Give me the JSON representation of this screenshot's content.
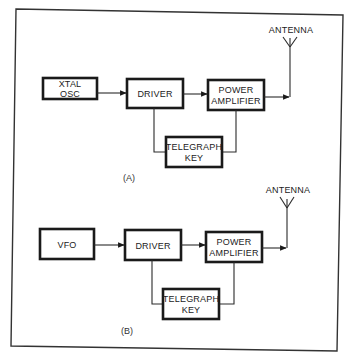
{
  "diagrams": [
    {
      "caption": "(A)",
      "blocks": {
        "oscillator": [
          "XTAL",
          "OSC"
        ],
        "driver": [
          "DRIVER"
        ],
        "power_amplifier": [
          "POWER",
          "AMPLIFIER"
        ],
        "telegraph_key": [
          "TELEGRAPH",
          "KEY"
        ]
      },
      "antenna_label": "ANTENNA"
    },
    {
      "caption": "(B)",
      "blocks": {
        "oscillator": [
          "VFO"
        ],
        "driver": [
          "DRIVER"
        ],
        "power_amplifier": [
          "POWER",
          "AMPLIFIER"
        ],
        "telegraph_key": [
          "TELEGRAPH",
          "KEY"
        ]
      },
      "antenna_label": "ANTENNA"
    }
  ],
  "colors": {
    "line": "#1a1a1a",
    "background": "#ffffff"
  }
}
